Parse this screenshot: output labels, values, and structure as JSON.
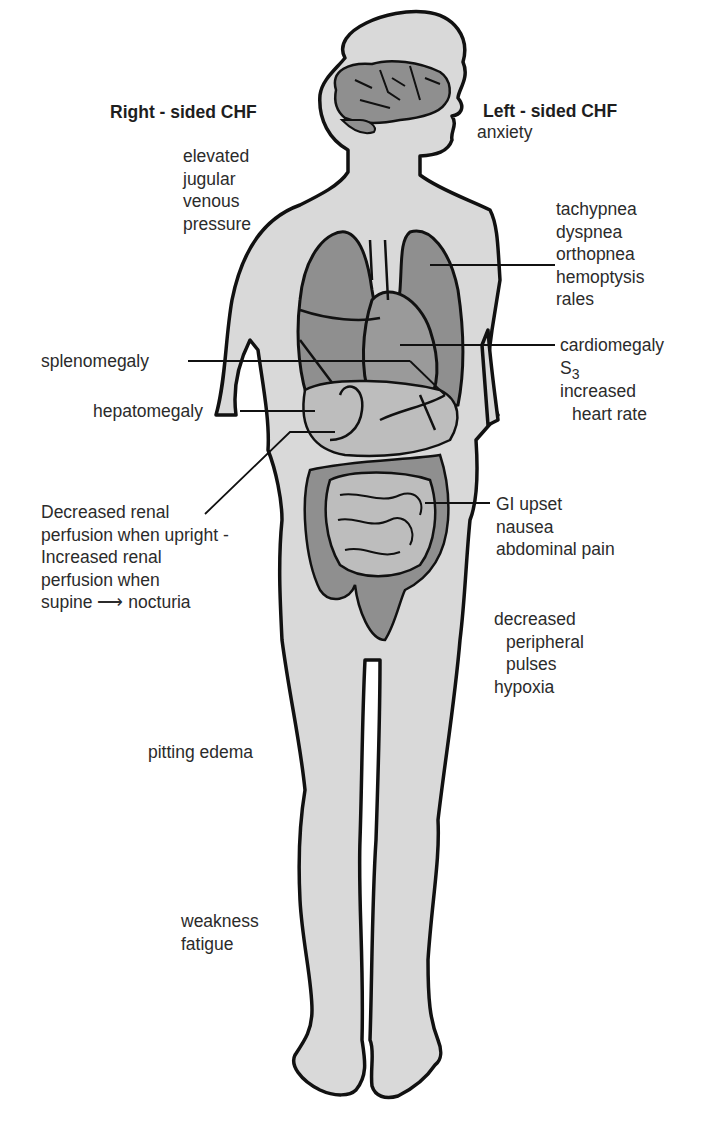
{
  "headings": {
    "right": "Right - sided CHF",
    "left": "Left - sided CHF"
  },
  "labels": {
    "anxiety": [
      "anxiety"
    ],
    "jvp": [
      "elevated",
      "jugular",
      "venous",
      "pressure"
    ],
    "respiratory": [
      "tachypnea",
      "dyspnea",
      "orthopnea",
      "hemoptysis",
      "rales"
    ],
    "cardiac": {
      "line1": "cardiomegaly",
      "s3_base": "S",
      "s3_sub": "3",
      "line3": "increased",
      "line4": "heart rate"
    },
    "splenomegaly": "splenomegaly",
    "hepatomegaly": "hepatomegaly",
    "renal": [
      "Decreased renal",
      "perfusion when upright -",
      "Increased renal",
      "perfusion when"
    ],
    "renal_last": {
      "before": "supine",
      "arrow": "⟶",
      "after": "nocturia"
    },
    "gi": [
      "GI upset",
      "nausea",
      "abdominal pain"
    ],
    "peripheral": [
      "decreased",
      "peripheral",
      "pulses",
      "hypoxia"
    ],
    "pitting_edema": "pitting edema",
    "weakness": [
      "weakness",
      "fatigue"
    ]
  },
  "colors": {
    "skin": "#d9d9d9",
    "organ": "#8f8f8f",
    "organ_light": "#bdbdbd",
    "outline": "#111111",
    "text": "#2b2b2b"
  }
}
